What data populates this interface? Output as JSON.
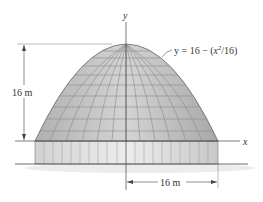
{
  "figure": {
    "axes": {
      "x_label": "x",
      "y_label": "y"
    },
    "equation": {
      "prefix": "y = 16 − (",
      "var": "x",
      "exp": "2",
      "suffix": "/16)"
    },
    "dimensions": {
      "height_label": "16 m",
      "radius_label": "16 m"
    },
    "colors": {
      "dome_fill": "#c4c4c4",
      "dome_grid": "#8a8a8a",
      "base_fill": "#dcdcdc",
      "line": "#333333",
      "shadow": "#e6e6e6"
    }
  }
}
